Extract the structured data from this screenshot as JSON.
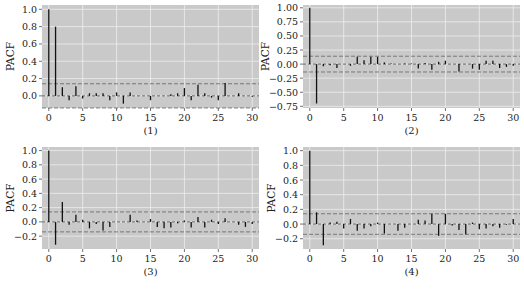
{
  "figure": {
    "panels": [
      {
        "label": "(1)",
        "ylabel": "PACF"
      },
      {
        "label": "(2)",
        "ylabel": "PACF"
      },
      {
        "label": "(3)",
        "ylabel": "PACF"
      },
      {
        "label": "(4)",
        "ylabel": "PACF"
      }
    ]
  },
  "chart_data": [
    {
      "type": "bar",
      "title": "(1)",
      "xlabel": "",
      "ylabel": "PACF",
      "ylim": [
        -0.14,
        1.05
      ],
      "yticks": [
        0.0,
        0.2,
        0.4,
        0.6,
        0.8,
        1.0
      ],
      "ytick_labels": [
        "0.0",
        "0.2",
        "0.4",
        "0.6",
        "0.8",
        "1.0"
      ],
      "xticks": [
        0,
        5,
        10,
        15,
        20,
        25,
        30
      ],
      "xlim": [
        -1,
        31
      ],
      "confidence_band": 0.14,
      "grid": true,
      "x": [
        0,
        1,
        2,
        3,
        4,
        5,
        6,
        7,
        8,
        9,
        10,
        11,
        12,
        13,
        14,
        15,
        16,
        17,
        18,
        19,
        20,
        21,
        22,
        23,
        24,
        25,
        26,
        27,
        28,
        29,
        30
      ],
      "values": [
        1.0,
        0.8,
        0.1,
        -0.05,
        0.11,
        -0.03,
        0.03,
        0.03,
        0.03,
        -0.05,
        0.04,
        -0.09,
        0.04,
        0.0,
        0.0,
        -0.05,
        0.0,
        0.0,
        0.02,
        0.03,
        0.09,
        -0.05,
        0.13,
        0.03,
        -0.02,
        -0.05,
        0.15,
        0.0,
        0.03,
        0.0,
        -0.01
      ]
    },
    {
      "type": "bar",
      "title": "(2)",
      "xlabel": "",
      "ylabel": "PACF",
      "ylim": [
        -0.78,
        1.05
      ],
      "yticks": [
        -0.75,
        -0.5,
        -0.25,
        0.0,
        0.25,
        0.5,
        0.75,
        1.0
      ],
      "ytick_labels": [
        "-0.75",
        "-0.50",
        "-0.25",
        "0.00",
        "0.25",
        "0.50",
        "0.75",
        "1.00"
      ],
      "xticks": [
        0,
        5,
        10,
        15,
        20,
        25,
        30
      ],
      "xlim": [
        -1,
        31
      ],
      "confidence_band": 0.14,
      "grid": true,
      "x": [
        0,
        1,
        2,
        3,
        4,
        5,
        6,
        7,
        8,
        9,
        10,
        11,
        12,
        13,
        14,
        15,
        16,
        17,
        18,
        19,
        20,
        21,
        22,
        23,
        24,
        25,
        26,
        27,
        28,
        29,
        30
      ],
      "values": [
        1.0,
        -0.7,
        -0.04,
        -0.02,
        -0.07,
        0.0,
        -0.03,
        0.13,
        0.07,
        0.13,
        0.13,
        0.03,
        0.01,
        0.0,
        0.01,
        0.01,
        -0.08,
        0.02,
        -0.1,
        0.04,
        0.06,
        0.0,
        -0.13,
        0.0,
        -0.08,
        -0.1,
        0.06,
        0.06,
        -0.07,
        -0.05,
        -0.03
      ]
    },
    {
      "type": "bar",
      "title": "(3)",
      "xlabel": "",
      "ylabel": "PACF",
      "ylim": [
        -0.38,
        1.05
      ],
      "yticks": [
        -0.2,
        0.0,
        0.2,
        0.4,
        0.6,
        0.8,
        1.0
      ],
      "ytick_labels": [
        "-0.2",
        "0.0",
        "0.2",
        "0.4",
        "0.6",
        "0.8",
        "1.0"
      ],
      "xticks": [
        0,
        5,
        10,
        15,
        20,
        25,
        30
      ],
      "xlim": [
        -1,
        31
      ],
      "confidence_band": 0.14,
      "grid": true,
      "x": [
        0,
        1,
        2,
        3,
        4,
        5,
        6,
        7,
        8,
        9,
        10,
        11,
        12,
        13,
        14,
        15,
        16,
        17,
        18,
        19,
        20,
        21,
        22,
        23,
        24,
        25,
        26,
        27,
        28,
        29,
        30
      ],
      "values": [
        1.0,
        -0.32,
        0.28,
        -0.04,
        0.1,
        0.03,
        -0.09,
        -0.03,
        -0.12,
        -0.07,
        0.0,
        0.0,
        0.1,
        0.02,
        0.0,
        0.04,
        -0.07,
        -0.09,
        -0.08,
        -0.02,
        0.02,
        -0.08,
        0.07,
        -0.08,
        0.03,
        -0.03,
        0.05,
        0.0,
        -0.04,
        -0.07,
        -0.03
      ]
    },
    {
      "type": "bar",
      "title": "(4)",
      "xlabel": "",
      "ylabel": "PACF",
      "ylim": [
        -0.34,
        1.05
      ],
      "yticks": [
        -0.2,
        0.0,
        0.2,
        0.4,
        0.6,
        0.8,
        1.0
      ],
      "ytick_labels": [
        "-0.2",
        "0.0",
        "0.2",
        "0.4",
        "0.6",
        "0.8",
        "1.0"
      ],
      "xticks": [
        0,
        5,
        10,
        15,
        20,
        25,
        30
      ],
      "xlim": [
        -1,
        31
      ],
      "confidence_band": 0.14,
      "grid": true,
      "x": [
        0,
        1,
        2,
        3,
        4,
        5,
        6,
        7,
        8,
        9,
        10,
        11,
        12,
        13,
        14,
        15,
        16,
        17,
        18,
        19,
        20,
        21,
        22,
        23,
        24,
        25,
        26,
        27,
        28,
        29,
        30
      ],
      "values": [
        1.0,
        0.16,
        -0.29,
        0.02,
        0.03,
        -0.06,
        0.07,
        -0.09,
        -0.06,
        -0.03,
        0.02,
        -0.13,
        0.0,
        -0.09,
        -0.05,
        0.0,
        0.06,
        0.05,
        0.14,
        -0.16,
        0.14,
        -0.02,
        -0.08,
        -0.14,
        0.02,
        -0.07,
        -0.06,
        -0.03,
        -0.05,
        -0.01,
        0.07
      ]
    }
  ]
}
